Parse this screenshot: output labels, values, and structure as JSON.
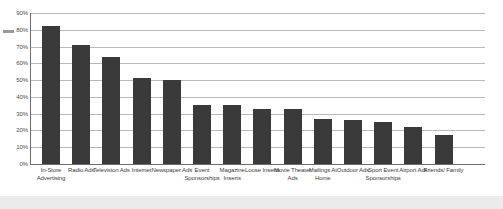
{
  "chart_data": {
    "type": "bar",
    "title": "",
    "subtitle": "",
    "xlabel": "",
    "ylabel": "",
    "ylim": [
      0,
      90
    ],
    "grid": true,
    "legend": "none",
    "tick_suffix": "%",
    "yticks": [
      "0%",
      "10%",
      "20%",
      "30%",
      "40%",
      "50%",
      "60%",
      "70%",
      "80%",
      "90%"
    ],
    "ytick_values": [
      0,
      10,
      20,
      30,
      40,
      50,
      60,
      70,
      80,
      90
    ],
    "categories": [
      "In-Store Advertising",
      "Radio Ads",
      "Television Ads",
      "Internet",
      "Newspaper Ads",
      "Event Sponsorships",
      "Magazine Inserts",
      "Loose Inserts",
      "Movie Theater Ads",
      "Mailings At Home",
      "Outdoor Ads",
      "Sport Event Sponsorships",
      "Airport Ads",
      "Friends/ Family"
    ],
    "values": [
      82,
      71,
      64,
      51,
      50,
      35,
      35,
      33,
      33,
      27,
      26,
      25,
      22,
      17
    ],
    "bar_color": "#3a3a3a",
    "gridline_color": "#b9b9b9",
    "axis_color": "#6e6e6e",
    "background_color": "#ffffff"
  }
}
